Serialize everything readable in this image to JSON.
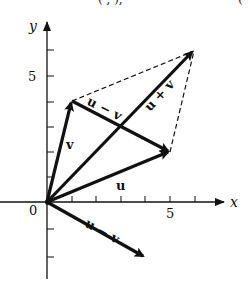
{
  "top_text_cutoff": {
    "left_fragment": "(  ,  ),",
    "right_fragment": "("
  },
  "axes": {
    "x_label": "x",
    "y_label": "y",
    "origin_label": "0",
    "x_tick_label": "5",
    "y_tick_label": "5",
    "x_ticks": [
      1,
      2,
      3,
      4,
      5,
      6
    ],
    "y_ticks": [
      -3,
      -2,
      -1,
      1,
      2,
      3,
      4,
      5,
      6
    ]
  },
  "vectors": {
    "u": {
      "label": "u",
      "from": [
        0,
        0
      ],
      "to": [
        5,
        2
      ]
    },
    "v": {
      "label": "v",
      "from": [
        0,
        0
      ],
      "to": [
        1,
        4
      ]
    },
    "u_plus_v": {
      "label": "u + v",
      "from": [
        0,
        0
      ],
      "to": [
        6,
        6
      ]
    },
    "u_minus_v_translated": {
      "label": "u − v",
      "from": [
        1,
        4
      ],
      "to": [
        5,
        2
      ]
    },
    "u_minus_v": {
      "label": "u − v",
      "from": [
        0,
        0
      ],
      "to": [
        4,
        -2
      ]
    }
  },
  "dashed_edges": [
    {
      "from": [
        1,
        4
      ],
      "to": [
        6,
        6
      ]
    },
    {
      "from": [
        5,
        2
      ],
      "to": [
        6,
        6
      ]
    }
  ],
  "colors": {
    "ink": "#111111",
    "background": "#ffffff"
  }
}
